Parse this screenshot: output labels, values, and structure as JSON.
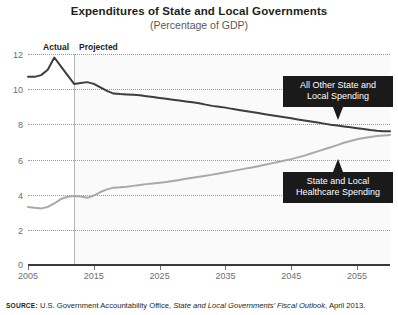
{
  "title": "Expenditures of State and Local Governments",
  "subtitle": "(Percentage of GDP)",
  "segments": {
    "actual_label": "Actual",
    "projected_label": "Projected",
    "divider_year": 2012
  },
  "callouts": {
    "upper": "All Other State and\nLocal Spending",
    "lower": "State and Local\nHealthcare Spending"
  },
  "source": {
    "label": "SOURCE:",
    "text_before": " U.S. Government Accountability Office, ",
    "publication": "State and Local Governments’ Fiscal Outlook",
    "text_after": ", April 2013."
  },
  "colors": {
    "upper_line": "#3d3d3d",
    "lower_line": "#a7a9ac",
    "callout_bg": "#1a1a1a",
    "axis": "#3a3a3a",
    "grid": "#9a9a9a",
    "tick_text": "#6d6e71"
  },
  "chart_data": {
    "type": "line",
    "title": "Expenditures of State and Local Governments",
    "subtitle": "(Percentage of GDP)",
    "xlabel": "",
    "ylabel": "Percentage of GDP",
    "xlim": [
      2005,
      2060
    ],
    "ylim": [
      0,
      12
    ],
    "yticks": [
      0,
      2,
      4,
      6,
      8,
      10,
      12
    ],
    "xticks": [
      2005,
      2015,
      2025,
      2035,
      2045,
      2055
    ],
    "grid": "horizontal-dotted",
    "legend": "annotated-callouts",
    "annotations": [
      {
        "text": "Actual",
        "x": 2009,
        "note": "left of divider"
      },
      {
        "text": "Projected",
        "x": 2015,
        "note": "right of divider"
      },
      {
        "text": "All Other State and Local Spending",
        "points_to": "upper-series"
      },
      {
        "text": "State and Local Healthcare Spending",
        "points_to": "lower-series"
      }
    ],
    "x": [
      2005,
      2006,
      2007,
      2008,
      2009,
      2010,
      2011,
      2012,
      2013,
      2014,
      2015,
      2016,
      2017,
      2018,
      2019,
      2020,
      2021,
      2022,
      2023,
      2024,
      2025,
      2026,
      2027,
      2028,
      2029,
      2030,
      2031,
      2032,
      2033,
      2034,
      2035,
      2036,
      2037,
      2038,
      2039,
      2040,
      2041,
      2042,
      2043,
      2044,
      2045,
      2046,
      2047,
      2048,
      2049,
      2050,
      2051,
      2052,
      2053,
      2054,
      2055,
      2056,
      2057,
      2058,
      2059,
      2060
    ],
    "series": [
      {
        "name": "All Other State and Local Spending",
        "color": "#3d3d3d",
        "values": [
          10.7,
          10.7,
          10.8,
          11.1,
          11.8,
          11.3,
          10.8,
          10.3,
          10.35,
          10.4,
          10.3,
          10.1,
          9.9,
          9.75,
          9.72,
          9.7,
          9.68,
          9.65,
          9.6,
          9.55,
          9.5,
          9.45,
          9.4,
          9.35,
          9.3,
          9.25,
          9.2,
          9.12,
          9.05,
          9.0,
          8.95,
          8.88,
          8.82,
          8.76,
          8.7,
          8.64,
          8.58,
          8.52,
          8.46,
          8.4,
          8.34,
          8.28,
          8.22,
          8.16,
          8.1,
          8.04,
          7.98,
          7.93,
          7.88,
          7.83,
          7.78,
          7.73,
          7.68,
          7.64,
          7.61,
          7.6
        ]
      },
      {
        "name": "State and Local Healthcare Spending",
        "color": "#a7a9ac",
        "values": [
          3.3,
          3.25,
          3.22,
          3.3,
          3.5,
          3.75,
          3.88,
          3.92,
          3.9,
          3.82,
          3.95,
          4.15,
          4.3,
          4.4,
          4.42,
          4.45,
          4.5,
          4.55,
          4.6,
          4.64,
          4.68,
          4.72,
          4.78,
          4.84,
          4.9,
          4.96,
          5.02,
          5.08,
          5.14,
          5.2,
          5.27,
          5.34,
          5.41,
          5.48,
          5.55,
          5.62,
          5.7,
          5.78,
          5.86,
          5.94,
          6.02,
          6.12,
          6.22,
          6.34,
          6.46,
          6.58,
          6.7,
          6.82,
          6.95,
          7.05,
          7.15,
          7.22,
          7.28,
          7.33,
          7.37,
          7.4
        ]
      }
    ]
  }
}
